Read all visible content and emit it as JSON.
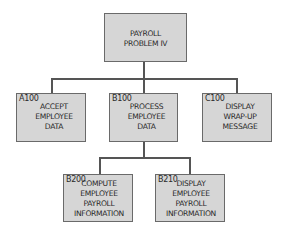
{
  "diagram": {
    "type": "hierarchy-chart",
    "root": {
      "id": "root",
      "code": "",
      "lines": [
        "PAYROLL",
        "PROBLEM IV"
      ]
    },
    "level1": [
      {
        "id": "A100",
        "code": "A100",
        "lines": [
          "ACCEPT",
          "EMPLOYEE",
          "DATA"
        ]
      },
      {
        "id": "B100",
        "code": "B100",
        "lines": [
          "PROCESS",
          "EMPLOYEE",
          "DATA"
        ]
      },
      {
        "id": "C100",
        "code": "C100",
        "lines": [
          "DISPLAY",
          "WRAP-UP",
          "MESSAGE"
        ]
      }
    ],
    "level2": [
      {
        "id": "B200",
        "parent": "B100",
        "code": "B200",
        "lines": [
          "COMPUTE",
          "EMPLOYEE",
          "PAYROLL",
          "INFORMATION"
        ]
      },
      {
        "id": "B210",
        "parent": "B100",
        "code": "B210",
        "lines": [
          "DISPLAY",
          "EMPLOYEE",
          "PAYROLL",
          "INFORMATION"
        ]
      }
    ],
    "colors": {
      "box_fill": "#d6d6d6",
      "box_border": "#6a6a6a",
      "connector": "#555555",
      "text": "#2a2a2a"
    }
  }
}
